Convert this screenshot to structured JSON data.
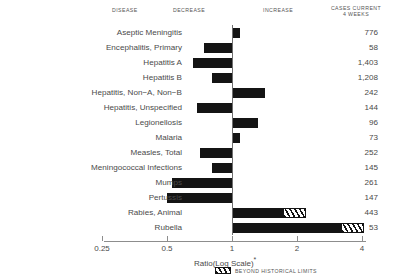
{
  "headers": {
    "disease": "DISEASE",
    "decrease": "DECREASE",
    "increase": "INCREASE",
    "cases_line1": "CASES CURRENT",
    "cases_line2": "4 WEEKS"
  },
  "axis_title": "Ratio(Log Scale)",
  "axis_title_marker": "*",
  "legend": {
    "label": "BEYOND HISTORICAL LIMITS"
  },
  "colors": {
    "bar": "#141414",
    "axis": "#8d8d8d",
    "text": "#4a4a4a",
    "background": "#ffffff"
  },
  "chart_data": {
    "type": "bar",
    "title": "",
    "subtitle": "",
    "orientation": "horizontal",
    "xlabel": "Ratio(Log Scale)*",
    "ylabel": "DISEASE",
    "scale": "log",
    "xlim": [
      0.25,
      4
    ],
    "ticks": [
      0.25,
      0.5,
      1,
      2,
      4
    ],
    "tick_labels": [
      "0.25",
      "0.5",
      "1",
      "2",
      "4"
    ],
    "reference_line": 1,
    "grid": false,
    "legend_position": "bottom-center",
    "legend_entries": [
      "BEYOND HISTORICAL LIMITS"
    ],
    "annotations": [
      "DECREASE",
      "INCREASE"
    ],
    "value_column_header": "CASES CURRENT 4 WEEKS",
    "categories": [
      "Aseptic Meningitis",
      "Encephalitis, Primary",
      "Hepatitis A",
      "Hepatitis B",
      "Hepatitis, Non−A, Non−B",
      "Hepatitis, Unspecified",
      "Legionellosis",
      "Malaria",
      "Measles, Total",
      "Meningococcal Infections",
      "Mumps",
      "Pertussis",
      "Rabies, Animal",
      "Rubella"
    ],
    "series": [
      {
        "name": "Ratio",
        "values": [
          1.09,
          0.74,
          0.66,
          0.81,
          1.42,
          0.69,
          1.32,
          1.09,
          0.71,
          0.81,
          0.53,
          0.5,
          1.73,
          3.2
        ]
      },
      {
        "name": "Beyond Historical Limits",
        "values": [
          null,
          null,
          null,
          null,
          null,
          null,
          null,
          null,
          null,
          null,
          null,
          null,
          2.2,
          4.1
        ]
      }
    ],
    "cases_current_4_weeks": [
      "776",
      "58",
      "1,403",
      "1,208",
      "242",
      "144",
      "96",
      "73",
      "252",
      "145",
      "261",
      "147",
      "443",
      "53"
    ]
  },
  "rows": [
    {
      "label": "Aseptic Meningitis",
      "cases": "776",
      "ratio": 1.09,
      "limit": null
    },
    {
      "label": "Encephalitis, Primary",
      "cases": "58",
      "ratio": 0.74,
      "limit": null
    },
    {
      "label": "Hepatitis A",
      "cases": "1,403",
      "ratio": 0.66,
      "limit": null
    },
    {
      "label": "Hepatitis B",
      "cases": "1,208",
      "ratio": 0.81,
      "limit": null
    },
    {
      "label": "Hepatitis, Non−A, Non−B",
      "cases": "242",
      "ratio": 1.42,
      "limit": null
    },
    {
      "label": "Hepatitis, Unspecified",
      "cases": "144",
      "ratio": 0.69,
      "limit": null
    },
    {
      "label": "Legionellosis",
      "cases": "96",
      "ratio": 1.32,
      "limit": null
    },
    {
      "label": "Malaria",
      "cases": "73",
      "ratio": 1.09,
      "limit": null
    },
    {
      "label": "Measles, Total",
      "cases": "252",
      "ratio": 0.71,
      "limit": null
    },
    {
      "label": "Meningococcal Infections",
      "cases": "145",
      "ratio": 0.81,
      "limit": null
    },
    {
      "label": "Mumps",
      "cases": "261",
      "ratio": 0.53,
      "limit": null
    },
    {
      "label": "Pertussis",
      "cases": "147",
      "ratio": 0.5,
      "limit": null
    },
    {
      "label": "Rabies, Animal",
      "cases": "443",
      "ratio": 1.73,
      "limit": 2.2
    },
    {
      "label": "Rubella",
      "cases": "53",
      "ratio": 3.2,
      "limit": 4.1
    }
  ]
}
